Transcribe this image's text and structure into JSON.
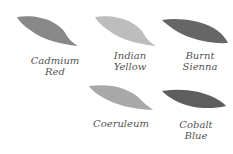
{
  "swatches": [
    {
      "name": "Cadmium Red",
      "line1": "Cadmium",
      "line2": "Red",
      "color": "#888888"
    },
    {
      "name": "Indian Yellow",
      "line1": "Indian",
      "line2": "Yellow",
      "color": "#bdbdbd"
    },
    {
      "name": "Burnt Sienna",
      "line1": "Burnt",
      "line2": "Sienna",
      "color": "#6a6a6a"
    },
    {
      "name": "Coeruleum",
      "line1": "Coeruleum",
      "line2": "",
      "color": "#a8a8a8"
    },
    {
      "name": "Cobalt Blue",
      "line1": "Cobalt",
      "line2": "Blue",
      "color": "#5e5e5e"
    }
  ]
}
